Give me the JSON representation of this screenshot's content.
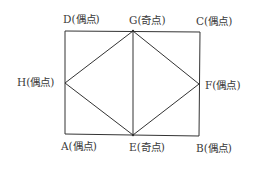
{
  "diagram": {
    "colors": {
      "line": "#333333",
      "text": "#3a3a3a",
      "background": "#ffffff"
    },
    "points": {
      "A": {
        "x": 65,
        "y": 134
      },
      "B": {
        "x": 199,
        "y": 136
      },
      "C": {
        "x": 200,
        "y": 32
      },
      "D": {
        "x": 65,
        "y": 31
      },
      "E": {
        "x": 133,
        "y": 135
      },
      "F": {
        "x": 199,
        "y": 84
      },
      "G": {
        "x": 133,
        "y": 31
      },
      "H": {
        "x": 65,
        "y": 83
      }
    },
    "edges": [
      [
        "D",
        "G"
      ],
      [
        "G",
        "C"
      ],
      [
        "C",
        "F"
      ],
      [
        "F",
        "B"
      ],
      [
        "B",
        "E"
      ],
      [
        "E",
        "A"
      ],
      [
        "A",
        "H"
      ],
      [
        "H",
        "D"
      ],
      [
        "H",
        "G"
      ],
      [
        "G",
        "F"
      ],
      [
        "F",
        "E"
      ],
      [
        "E",
        "H"
      ],
      [
        "G",
        "E"
      ]
    ],
    "labels": {
      "D": "D(偶点)",
      "G": "G(奇点)",
      "C": "C(偶点)",
      "H": "H(偶点)",
      "F": "F(偶点)",
      "A": "A(偶点)",
      "E": "E(奇点)",
      "B": "B(偶点)"
    }
  }
}
